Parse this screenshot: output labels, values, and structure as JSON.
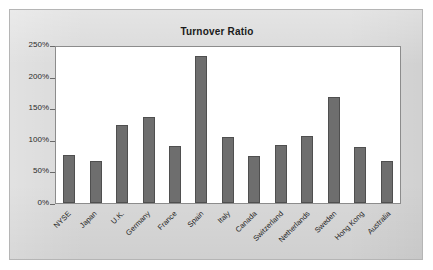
{
  "chart_data": {
    "type": "bar",
    "title": "Turnover Ratio",
    "xlabel": "",
    "ylabel": "",
    "categories": [
      "NYSE",
      "Japan",
      "U.K.",
      "Germany",
      "France",
      "Spain",
      "Italy",
      "Canada",
      "Switzerland",
      "Netherlands",
      "Sweden",
      "Hong Kong",
      "Australia"
    ],
    "values": [
      76,
      66,
      124,
      136,
      91,
      232,
      104,
      75,
      92,
      106,
      168,
      88,
      66
    ],
    "value_unit": "%",
    "ylim": [
      0,
      250
    ],
    "ytick_values": [
      0,
      50,
      100,
      150,
      200,
      250
    ],
    "ytick_labels": [
      "0%",
      "50%",
      "100%",
      "150%",
      "200%",
      "250%"
    ],
    "grid": false,
    "legend": null,
    "bar_color": "#6e6e6e",
    "plot_background": "#ffffff",
    "panel_background": "#d9d9d9",
    "axis_color": "#8c8c8c",
    "xlabel_rotation": -45
  }
}
